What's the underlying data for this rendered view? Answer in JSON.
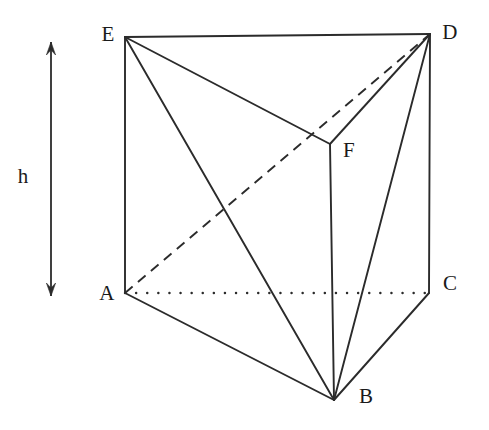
{
  "figure": {
    "type": "geometry-diagram",
    "shape": "triangular prism",
    "background_color": "#ffffff",
    "stroke_color": "#2b2b2b",
    "width": 489,
    "height": 430
  },
  "vertices": [
    {
      "id": "E",
      "label": "E",
      "x": 125,
      "y": 37,
      "label_x": 108,
      "label_y": 34
    },
    {
      "id": "D",
      "label": "D",
      "x": 430,
      "y": 34,
      "label_x": 450,
      "label_y": 32
    },
    {
      "id": "F",
      "label": "F",
      "x": 330,
      "y": 144,
      "label_x": 349,
      "label_y": 150
    },
    {
      "id": "A",
      "label": "A",
      "x": 125,
      "y": 293,
      "label_x": 107,
      "label_y": 293
    },
    {
      "id": "C",
      "label": "C",
      "x": 429,
      "y": 293,
      "label_x": 450,
      "label_y": 283
    },
    {
      "id": "B",
      "label": "B",
      "x": 334,
      "y": 400,
      "label_x": 366,
      "label_y": 396
    }
  ],
  "edges": [
    {
      "name": "edge-E-D",
      "from": "E",
      "to": "D",
      "style": "solid"
    },
    {
      "name": "edge-E-F",
      "from": "E",
      "to": "F",
      "style": "solid"
    },
    {
      "name": "edge-D-F",
      "from": "D",
      "to": "F",
      "style": "solid"
    },
    {
      "name": "edge-E-A",
      "from": "E",
      "to": "A",
      "style": "solid"
    },
    {
      "name": "edge-D-C",
      "from": "D",
      "to": "C",
      "style": "solid"
    },
    {
      "name": "edge-F-B",
      "from": "F",
      "to": "B",
      "style": "solid"
    },
    {
      "name": "edge-A-B",
      "from": "A",
      "to": "B",
      "style": "solid"
    },
    {
      "name": "edge-C-B",
      "from": "C",
      "to": "B",
      "style": "solid"
    },
    {
      "name": "diagonal-E-B",
      "from": "E",
      "to": "B",
      "style": "solid"
    },
    {
      "name": "diagonal-D-B",
      "from": "D",
      "to": "B",
      "style": "solid"
    },
    {
      "name": "hidden-diagonal-A-D",
      "from": "A",
      "to": "D",
      "style": "dashed"
    },
    {
      "name": "hidden-edge-A-C",
      "from": "A",
      "to": "C",
      "style": "dotted"
    }
  ],
  "annotations": {
    "height_arrow": {
      "label": "h",
      "label_x": 23,
      "label_y": 176,
      "line_x": 51,
      "top_y": 42,
      "bottom_y": 296
    }
  }
}
